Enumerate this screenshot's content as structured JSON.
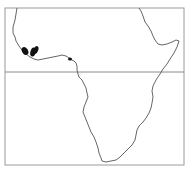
{
  "map": {
    "region": "Africa",
    "type": "species distribution map",
    "frame": {
      "x": 5,
      "y": 8,
      "width": 179,
      "height": 157
    },
    "equator_y": 72,
    "colors": {
      "background": "#ffffff",
      "coastline": "#555555",
      "frame": "#9a9a9a",
      "equator": "#8a8a8a",
      "range_fill": "#111111"
    },
    "coastline_path": "M17,8 L16,14 L15,20 L13,27 L13,33 L15,37 L16,41 L19,46 L22,50 L26,54 L30,57 L34,59 L38,60 L43,59 L48,58 L53,57 L58,56 L62,55 L66,56 L69,58 L72,60 L74,61 L76,63 L77,66 L77,70 L78,74 L79,77 L82,80 L84,84 L86,88 L87,93 L88,97 L86,102 L84,107 L83,112 L85,117 L87,122 L89,127 L91,132 L94,137 L96,142 L98,148 L99,153 L101,158 L102,161 L106,162 L111,161 L116,160 L120,157 L124,153 L128,149 L132,145 L135,140 L136,135 L137,130 L139,126 L143,122 L146,118 L149,113 L151,108 L152,103 L153,97 L152,91 L153,86 L156,80 L160,74 L163,69 L167,64 L170,59 L174,53 L177,47 L179,41 L176,40 L172,42 L167,44 L162,45 L158,44 L155,40 L153,36 L151,31 L148,26 L145,22 L143,16 L141,11 L139,8",
    "range_patches": [
      {
        "name": "range-patch-west",
        "cx": 25,
        "cy": 51,
        "rx": 3,
        "ry": 4.2,
        "rotate": -30
      },
      {
        "name": "range-patch-central",
        "cx": 33,
        "cy": 52,
        "rx": 2.6,
        "ry": 4.6,
        "rotate": 15
      },
      {
        "name": "range-patch-east",
        "cx": 36,
        "cy": 50,
        "rx": 2.2,
        "ry": 4,
        "rotate": 20
      },
      {
        "name": "range-patch-gulf",
        "cx": 70,
        "cy": 59,
        "rx": 2,
        "ry": 1.6,
        "rotate": 0
      }
    ]
  }
}
